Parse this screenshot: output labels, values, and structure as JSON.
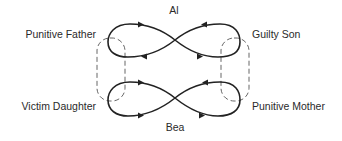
{
  "diagram": {
    "type": "family-interaction-loops",
    "nodes": {
      "top_center": "Al",
      "bottom_center": "Bea",
      "top_left": "Punitive Father",
      "top_right": "Guilty Son",
      "bottom_left": "Victim Daughter",
      "bottom_right": "Punitive Mother"
    },
    "structures": [
      {
        "name": "Al figure-eight loop",
        "connects": [
          "Punitive Father",
          "Guilty Son"
        ]
      },
      {
        "name": "Bea figure-eight loop",
        "connects": [
          "Victim Daughter",
          "Punitive Mother"
        ]
      },
      {
        "name": "left dashed link",
        "connects": [
          "Punitive Father",
          "Victim Daughter"
        ]
      },
      {
        "name": "right dashed link",
        "connects": [
          "Guilty Son",
          "Punitive Mother"
        ]
      }
    ],
    "colors": {
      "line": "#222222",
      "dashed": "#555555",
      "text": "#2a2a2a",
      "background": "#ffffff"
    }
  }
}
